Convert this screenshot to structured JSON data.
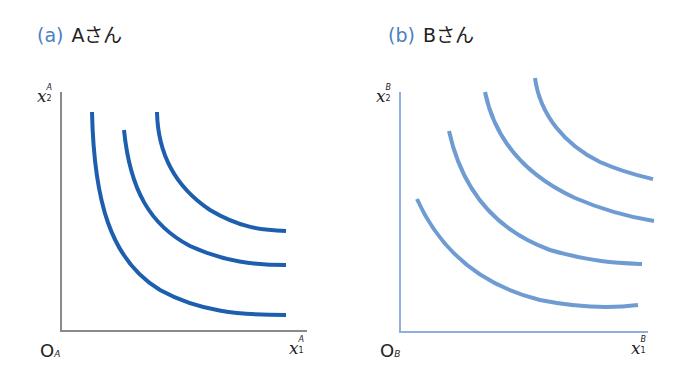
{
  "panels": [
    {
      "id": "a",
      "tag": "(a)",
      "title": "Aさん",
      "origin": "O",
      "origin_sub": "A",
      "x_axis": {
        "var": "x",
        "sub": "1",
        "sup": "A"
      },
      "y_axis": {
        "var": "x",
        "sub": "2",
        "sup": "A"
      },
      "axis_color": "#8a8a8a",
      "curve_color": "#1d5fae",
      "curve_count": 3
    },
    {
      "id": "b",
      "tag": "(b)",
      "title": "Bさん",
      "origin": "O",
      "origin_sub": "B",
      "x_axis": {
        "var": "x",
        "sub": "1",
        "sup": "B"
      },
      "y_axis": {
        "var": "x",
        "sub": "2",
        "sup": "B"
      },
      "axis_color": "#8fb0dc",
      "curve_color": "#6f9bd3",
      "curve_count": 4
    }
  ],
  "colors": {
    "tag": "#4a7fc1",
    "text": "#222222"
  }
}
